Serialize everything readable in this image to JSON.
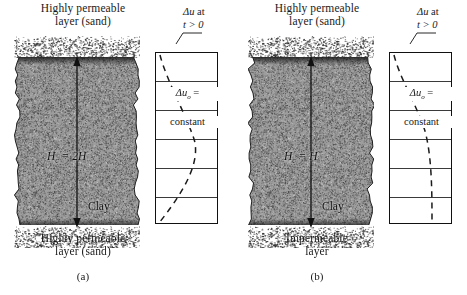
{
  "figure": {
    "type": "engineering-diagram",
    "background_color": "#ffffff",
    "clay_color": "#9a9a9a",
    "sand_color": "#ffffff",
    "line_color": "#111111"
  },
  "panels": [
    {
      "id": "a",
      "caption": "(a)",
      "top_layer_label": "Highly permeable\nlayer (sand)",
      "bottom_layer_label": "Highly permeable\nlayer (sand)",
      "soil_label": "Clay",
      "drainage_label_main": "H",
      "drainage_label_sub": "c",
      "drainage_label_eq": "= 2H",
      "drainage_label_full": "Hc = 2H",
      "drainage_arrows": "double-headed-vertical",
      "pressure_box": {
        "divisions": 6,
        "annotation_line1": "Δu",
        "annotation_line1_sub": "o",
        "annotation_line1_eq": "=",
        "annotation_line2": "constant",
        "curve_style": "dashed",
        "curve_description": "isochrone sloping from upper-left to lower-left (drainage both faces)"
      },
      "callout": {
        "line1_sym": "Δu",
        "line1_text": " at",
        "line2": "t > 0"
      }
    },
    {
      "id": "b",
      "caption": "(b)",
      "top_layer_label": "Highly permeable\nlayer (sand)",
      "bottom_layer_label": "Impermeable\nlayer",
      "soil_label": "Clay",
      "drainage_label_main": "H",
      "drainage_label_sub": "c",
      "drainage_label_eq": "= H",
      "drainage_label_full": "Hc = H",
      "drainage_arrows": "double-headed-vertical",
      "pressure_box": {
        "divisions": 6,
        "annotation_line1": "Δu",
        "annotation_line1_sub": "o",
        "annotation_line1_eq": "=",
        "annotation_line2": "constant",
        "curve_style": "dashed",
        "curve_description": "isochrone sloping from upper-left and becoming vertical near the impermeable base"
      },
      "callout": {
        "line1_sym": "Δu",
        "line1_text": " at",
        "line2": "t > 0"
      }
    }
  ]
}
